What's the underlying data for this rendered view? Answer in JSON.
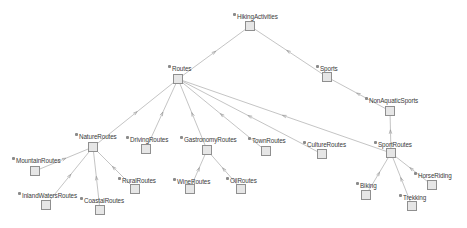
{
  "diagram": {
    "type": "class-hierarchy-graph",
    "colors": {
      "background": "#ffffff",
      "edge": "#b5b5b5",
      "node_fill": "#e6e6e6",
      "node_border": "#8f8f8f",
      "label_text": "#3a3a3a"
    },
    "nodes": [
      {
        "id": "HikingActivities",
        "label": "HikingActivities",
        "lx": 233,
        "ly": 13,
        "bx": 245,
        "by": 21
      },
      {
        "id": "Routes",
        "label": "Routes",
        "lx": 168,
        "ly": 65,
        "bx": 173,
        "by": 74
      },
      {
        "id": "Sports",
        "label": "Sports",
        "lx": 316,
        "ly": 65,
        "bx": 322,
        "by": 72
      },
      {
        "id": "NonAquaticSports",
        "label": "NonAquaticSports",
        "lx": 365,
        "ly": 97,
        "bx": 385,
        "by": 106
      },
      {
        "id": "NatureRoutes",
        "label": "NatureRoutes",
        "lx": 75,
        "ly": 133,
        "bx": 88,
        "by": 142
      },
      {
        "id": "DrivingRoutes",
        "label": "DrivingRoutes",
        "lx": 126,
        "ly": 136,
        "bx": 141,
        "by": 144
      },
      {
        "id": "GastronomyRoutes",
        "label": "GastronomyRoutes",
        "lx": 180,
        "ly": 136,
        "bx": 202,
        "by": 145
      },
      {
        "id": "TownRoutes",
        "label": "TownRoutes",
        "lx": 248,
        "ly": 137,
        "bx": 261,
        "by": 146
      },
      {
        "id": "CultureRoutes",
        "label": "CultureRoutes",
        "lx": 303,
        "ly": 141,
        "bx": 317,
        "by": 149
      },
      {
        "id": "SportRoutes",
        "label": "SportRoutes",
        "lx": 374,
        "ly": 141,
        "bx": 386,
        "by": 148
      },
      {
        "id": "MountainRoutes",
        "label": "MountainRoutes",
        "lx": 12,
        "ly": 157,
        "bx": 30,
        "by": 166
      },
      {
        "id": "InlandWatersRoutes",
        "label": "InlandWatersRoutes",
        "lx": 18,
        "ly": 192,
        "bx": 41,
        "by": 200
      },
      {
        "id": "CoastalRoutes",
        "label": "CoastalRoutes",
        "lx": 80,
        "ly": 197,
        "bx": 95,
        "by": 205
      },
      {
        "id": "RuralRoutes",
        "label": "RuralRoutes",
        "lx": 118,
        "ly": 177,
        "bx": 130,
        "by": 184
      },
      {
        "id": "WineRoutes",
        "label": "WineRoutes",
        "lx": 173,
        "ly": 178,
        "bx": 185,
        "by": 184
      },
      {
        "id": "OilRoutes",
        "label": "OilRoutes",
        "lx": 226,
        "ly": 177,
        "bx": 236,
        "by": 184
      },
      {
        "id": "HorseRiding",
        "label": "HorseRiding",
        "lx": 414,
        "ly": 172,
        "bx": 427,
        "by": 180
      },
      {
        "id": "Biking",
        "label": "Biking",
        "lx": 356,
        "ly": 182,
        "bx": 361,
        "by": 190
      },
      {
        "id": "Trekking",
        "label": "Trekking",
        "lx": 399,
        "ly": 194,
        "bx": 407,
        "by": 201
      }
    ],
    "edges": [
      {
        "from": "HikingActivities",
        "to": "Routes"
      },
      {
        "from": "HikingActivities",
        "to": "Sports"
      },
      {
        "from": "Sports",
        "to": "NonAquaticSports"
      },
      {
        "from": "NonAquaticSports",
        "to": "SportRoutes"
      },
      {
        "from": "Routes",
        "to": "NatureRoutes"
      },
      {
        "from": "Routes",
        "to": "DrivingRoutes"
      },
      {
        "from": "Routes",
        "to": "GastronomyRoutes"
      },
      {
        "from": "Routes",
        "to": "TownRoutes"
      },
      {
        "from": "Routes",
        "to": "CultureRoutes"
      },
      {
        "from": "Routes",
        "to": "SportRoutes"
      },
      {
        "from": "NatureRoutes",
        "to": "MountainRoutes"
      },
      {
        "from": "NatureRoutes",
        "to": "InlandWatersRoutes"
      },
      {
        "from": "NatureRoutes",
        "to": "CoastalRoutes"
      },
      {
        "from": "NatureRoutes",
        "to": "RuralRoutes"
      },
      {
        "from": "GastronomyRoutes",
        "to": "WineRoutes"
      },
      {
        "from": "GastronomyRoutes",
        "to": "OilRoutes"
      },
      {
        "from": "SportRoutes",
        "to": "Biking"
      },
      {
        "from": "SportRoutes",
        "to": "Trekking"
      },
      {
        "from": "SportRoutes",
        "to": "HorseRiding"
      }
    ]
  }
}
